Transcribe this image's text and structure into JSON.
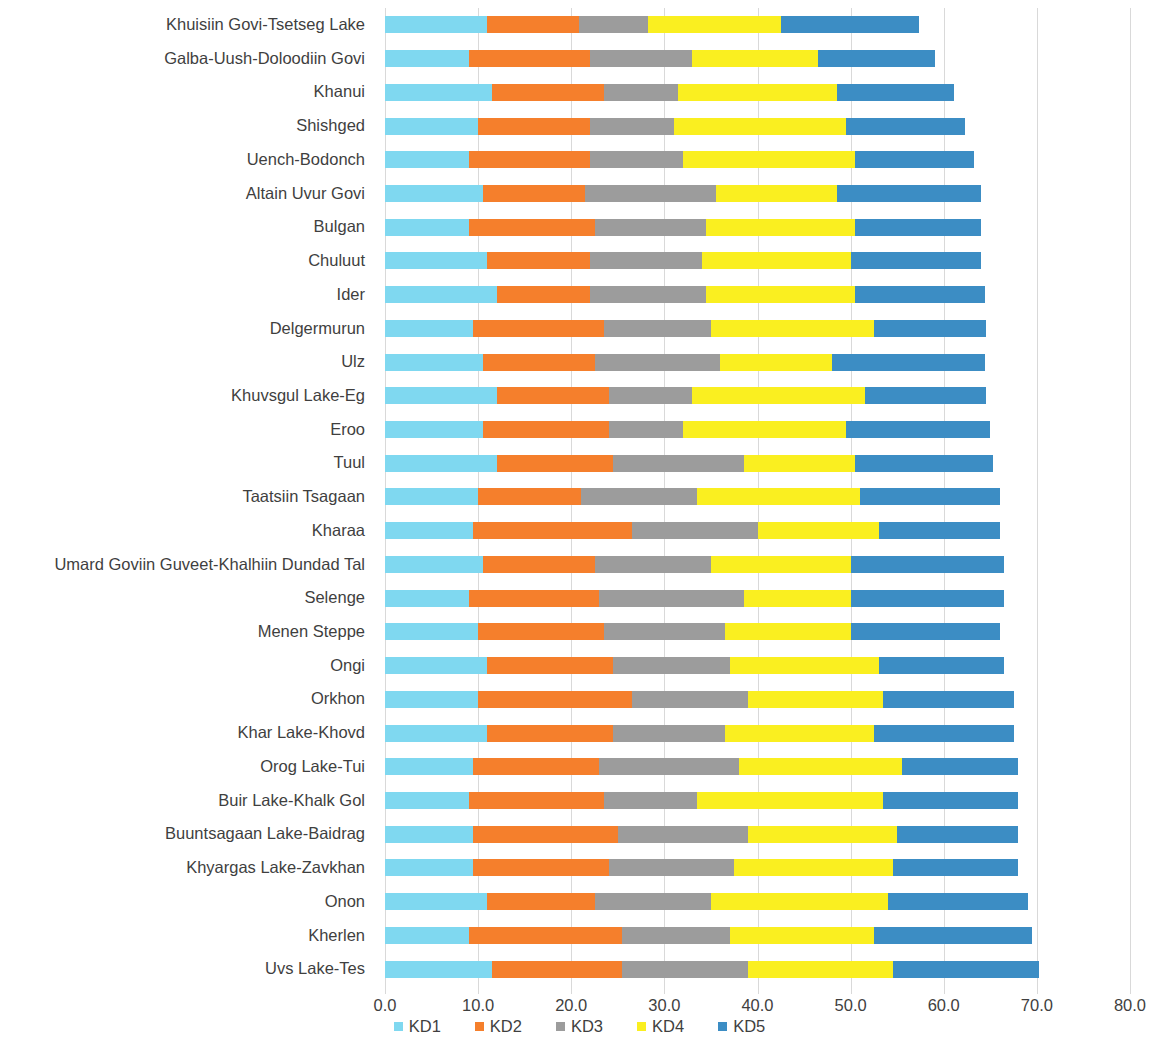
{
  "chart_data": {
    "type": "bar",
    "subtype": "horizontal-stacked",
    "title": "",
    "xlabel": "",
    "ylabel": "",
    "xlim": [
      0.0,
      80.0
    ],
    "xticks": [
      "0.0",
      "10.0",
      "20.0",
      "30.0",
      "40.0",
      "50.0",
      "60.0",
      "70.0",
      "80.0"
    ],
    "xtick_values": [
      0,
      10,
      20,
      30,
      40,
      50,
      60,
      70,
      80
    ],
    "grid": "vertical",
    "legend_position": "bottom",
    "colors": {
      "KD1": "#7FD8F0",
      "KD2": "#F57F2C",
      "KD3": "#9C9C9C",
      "KD4": "#FAEF20",
      "KD5": "#3C8DC4"
    },
    "legend": [
      "KD1",
      "KD2",
      "KD3",
      "KD4",
      "KD5"
    ],
    "categories": [
      "Khuisiin Govi-Tsetseg Lake",
      "Galba-Uush-Doloodiin Govi",
      "Khanui",
      "Shishged",
      "Uench-Bodonch",
      "Altain Uvur Govi",
      "Bulgan",
      "Chuluut",
      "Ider",
      "Delgermurun",
      "Ulz",
      "Khuvsgul Lake-Eg",
      "Eroo",
      "Tuul",
      "Taatsiin Tsagaan",
      "Kharaa",
      "Umard Goviin Guveet-Khalhiin Dundad Tal",
      "Selenge",
      "Menen Steppe",
      "Ongi",
      "Orkhon",
      "Khar Lake-Khovd",
      "Orog Lake-Tui",
      "Buir Lake-Khalk Gol",
      "Buuntsagaan Lake-Baidrag",
      "Khyargas Lake-Zavkhan",
      "Onon",
      "Kherlen",
      "Uvs Lake-Tes"
    ],
    "series": [
      {
        "name": "KD1",
        "values": [
          11.0,
          9.0,
          11.5,
          10.0,
          9.0,
          10.5,
          9.0,
          11.0,
          12.0,
          9.5,
          10.5,
          12.0,
          10.5,
          12.0,
          10.0,
          9.5,
          10.5,
          9.0,
          10.0,
          11.0,
          10.0,
          11.0,
          9.5,
          9.0,
          9.5,
          9.5,
          11.0,
          9.0,
          11.5
        ]
      },
      {
        "name": "KD2",
        "values": [
          9.8,
          13.0,
          12.0,
          12.0,
          13.0,
          11.0,
          13.5,
          11.0,
          10.0,
          14.0,
          12.0,
          12.0,
          13.5,
          12.5,
          11.0,
          17.0,
          12.0,
          14.0,
          13.5,
          13.5,
          16.5,
          13.5,
          13.5,
          14.5,
          15.5,
          14.5,
          11.5,
          16.5,
          14.0
        ]
      },
      {
        "name": "KD3",
        "values": [
          7.4,
          11.0,
          8.0,
          9.0,
          10.0,
          14.0,
          12.0,
          12.0,
          12.5,
          11.5,
          13.5,
          9.0,
          8.0,
          14.0,
          12.5,
          13.5,
          12.5,
          15.5,
          13.0,
          12.5,
          12.5,
          12.0,
          15.0,
          10.0,
          14.0,
          13.5,
          12.5,
          11.5,
          13.5
        ]
      },
      {
        "name": "KD4",
        "values": [
          14.3,
          13.5,
          17.0,
          18.5,
          18.5,
          13.0,
          16.0,
          16.0,
          16.0,
          17.5,
          12.0,
          18.5,
          17.5,
          12.0,
          17.5,
          13.0,
          15.0,
          11.5,
          13.5,
          16.0,
          14.5,
          16.0,
          17.5,
          20.0,
          16.0,
          17.0,
          19.0,
          15.5,
          15.5
        ]
      },
      {
        "name": "KD5",
        "values": [
          14.8,
          12.6,
          12.6,
          12.8,
          12.8,
          15.5,
          13.5,
          14.0,
          13.9,
          12.0,
          16.4,
          13.0,
          15.5,
          14.8,
          15.0,
          13.0,
          16.5,
          16.5,
          16.0,
          13.5,
          14.0,
          15.0,
          12.5,
          14.5,
          13.0,
          13.5,
          15.0,
          17.0,
          15.7
        ]
      }
    ],
    "totals": [
      57.3,
      59.1,
      61.1,
      62.3,
      63.3,
      64.0,
      64.0,
      64.0,
      64.4,
      64.5,
      64.4,
      64.5,
      65.0,
      65.3,
      66.0,
      66.0,
      66.5,
      66.5,
      66.0,
      66.5,
      67.5,
      67.5,
      68.0,
      68.0,
      68.0,
      68.0,
      69.0,
      69.5,
      70.2
    ]
  }
}
